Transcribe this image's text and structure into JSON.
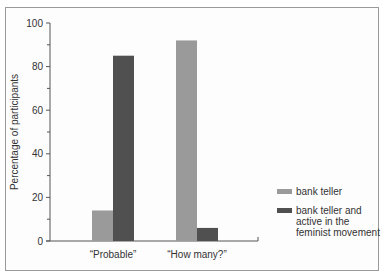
{
  "chart_data": {
    "type": "bar",
    "title": "",
    "xlabel": "",
    "ylabel": "Percentage of participants",
    "categories": [
      "“Probable”",
      "“How many?”"
    ],
    "series": [
      {
        "name": "bank teller",
        "color": "#9a9a9a",
        "values": [
          14,
          92
        ]
      },
      {
        "name": "bank teller and active in the feminist movement",
        "color": "#505050",
        "values": [
          85,
          6
        ]
      }
    ],
    "ylim": [
      0,
      100
    ],
    "yticks": [
      0,
      20,
      40,
      60,
      80,
      100
    ],
    "ytick_labels": [
      "0",
      "20",
      "40",
      "60",
      "80",
      "100"
    ],
    "grid": false,
    "legend_position": "right"
  },
  "legend": {
    "items": [
      {
        "label": "bank teller",
        "color": "#9a9a9a"
      },
      {
        "label": "bank teller and active in the feminist movement",
        "color": "#505050"
      }
    ]
  },
  "axis": {
    "ylabel": "Percentage of participants",
    "yticks": [
      "0",
      "20",
      "40",
      "60",
      "80",
      "100"
    ],
    "xcats": [
      "“Probable”",
      "“How many?”"
    ]
  }
}
